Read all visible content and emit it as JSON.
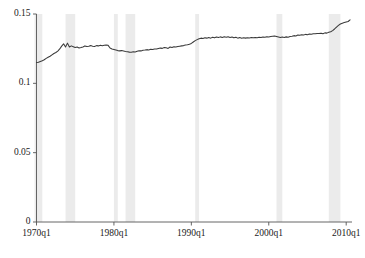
{
  "chart_data": {
    "type": "line",
    "title": "",
    "subtitle": "",
    "xlabel": "",
    "ylabel": "",
    "xlim": [
      1970.0,
      2010.75
    ],
    "ylim": [
      0,
      0.15
    ],
    "grid": false,
    "legend": null,
    "x_tick_labels": [
      "1970q1",
      "1980q1",
      "1990q1",
      "2000q1",
      "2010q1"
    ],
    "x_tick_values": [
      1970.0,
      1980.0,
      1990.0,
      2000.0,
      2010.0
    ],
    "y_tick_labels": [
      "0",
      "0.05",
      "0.1",
      "0.15"
    ],
    "y_tick_values": [
      0,
      0.05,
      0.1,
      0.15
    ],
    "line_color": "#3a3a3a",
    "recession_band_color": "#ebebeb",
    "axis_color": "#555555",
    "series": [
      {
        "name": "series1",
        "x": [
          1970.0,
          1970.25,
          1970.5,
          1970.75,
          1971.0,
          1971.25,
          1971.5,
          1971.75,
          1972.0,
          1972.25,
          1972.5,
          1972.75,
          1973.0,
          1973.25,
          1973.5,
          1973.75,
          1974.0,
          1974.25,
          1974.5,
          1974.75,
          1975.0,
          1975.25,
          1975.5,
          1975.75,
          1976.0,
          1976.25,
          1976.5,
          1976.75,
          1977.0,
          1977.25,
          1977.5,
          1977.75,
          1978.0,
          1978.25,
          1978.5,
          1978.75,
          1979.0,
          1979.25,
          1979.5,
          1979.75,
          1980.0,
          1980.25,
          1980.5,
          1980.75,
          1981.0,
          1981.25,
          1981.5,
          1981.75,
          1982.0,
          1982.25,
          1982.5,
          1982.75,
          1983.0,
          1983.25,
          1983.5,
          1983.75,
          1984.0,
          1984.25,
          1984.5,
          1984.75,
          1985.0,
          1985.25,
          1985.5,
          1985.75,
          1986.0,
          1986.25,
          1986.5,
          1986.75,
          1987.0,
          1987.25,
          1987.5,
          1987.75,
          1988.0,
          1988.25,
          1988.5,
          1988.75,
          1989.0,
          1989.25,
          1989.5,
          1989.75,
          1990.0,
          1990.25,
          1990.5,
          1990.75,
          1991.0,
          1991.25,
          1991.5,
          1991.75,
          1992.0,
          1992.25,
          1992.5,
          1992.75,
          1993.0,
          1993.25,
          1993.5,
          1993.75,
          1994.0,
          1994.25,
          1994.5,
          1994.75,
          1995.0,
          1995.25,
          1995.5,
          1995.75,
          1996.0,
          1996.25,
          1996.5,
          1996.75,
          1997.0,
          1997.25,
          1997.5,
          1997.75,
          1998.0,
          1998.25,
          1998.5,
          1998.75,
          1999.0,
          1999.25,
          1999.5,
          1999.75,
          2000.0,
          2000.25,
          2000.5,
          2000.75,
          2001.0,
          2001.25,
          2001.5,
          2001.75,
          2002.0,
          2002.25,
          2002.5,
          2002.75,
          2003.0,
          2003.25,
          2003.5,
          2003.75,
          2004.0,
          2004.25,
          2004.5,
          2004.75,
          2005.0,
          2005.25,
          2005.5,
          2005.75,
          2006.0,
          2006.25,
          2006.5,
          2006.75,
          2007.0,
          2007.25,
          2007.5,
          2007.75,
          2008.0,
          2008.25,
          2008.5,
          2008.75,
          2009.0,
          2009.25,
          2009.5,
          2009.75,
          2010.0,
          2010.25,
          2010.5
        ],
        "y": [
          0.115,
          0.1152,
          0.1158,
          0.1163,
          0.117,
          0.118,
          0.1188,
          0.1195,
          0.1205,
          0.1215,
          0.1222,
          0.1232,
          0.1248,
          0.1268,
          0.1285,
          0.1262,
          0.129,
          0.1262,
          0.127,
          0.1264,
          0.1258,
          0.1262,
          0.1255,
          0.1258,
          0.1262,
          0.127,
          0.1265,
          0.1268,
          0.1272,
          0.1268,
          0.1266,
          0.1272,
          0.127,
          0.1274,
          0.1271,
          0.1274,
          0.1276,
          0.1274,
          0.1255,
          0.1248,
          0.1244,
          0.124,
          0.1236,
          0.1234,
          0.1236,
          0.1233,
          0.123,
          0.1228,
          0.1225,
          0.1224,
          0.1228,
          0.1226,
          0.1231,
          0.1235,
          0.1234,
          0.1238,
          0.124,
          0.1243,
          0.1241,
          0.1245,
          0.1244,
          0.1248,
          0.1247,
          0.1251,
          0.1254,
          0.1252,
          0.1258,
          0.1256,
          0.1252,
          0.1262,
          0.1258,
          0.1264,
          0.1262,
          0.1266,
          0.1268,
          0.127,
          0.1272,
          0.1276,
          0.1278,
          0.1282,
          0.1288,
          0.1298,
          0.1308,
          0.1315,
          0.1322,
          0.1326,
          0.1324,
          0.1328,
          0.1326,
          0.133,
          0.1326,
          0.1332,
          0.1328,
          0.1334,
          0.133,
          0.1335,
          0.1331,
          0.1336,
          0.1332,
          0.1336,
          0.1331,
          0.1334,
          0.1328,
          0.1332,
          0.1326,
          0.133,
          0.1325,
          0.1328,
          0.1326,
          0.1329,
          0.1327,
          0.133,
          0.1328,
          0.1331,
          0.1329,
          0.1333,
          0.133,
          0.1334,
          0.1332,
          0.1336,
          0.1334,
          0.1338,
          0.134,
          0.1342,
          0.1338,
          0.1334,
          0.133,
          0.1334,
          0.1331,
          0.1335,
          0.1333,
          0.1338,
          0.134,
          0.1344,
          0.1342,
          0.1348,
          0.1346,
          0.135,
          0.1348,
          0.1353,
          0.1351,
          0.1356,
          0.1354,
          0.1358,
          0.1357,
          0.136,
          0.1359,
          0.1362,
          0.1358,
          0.1364,
          0.1362,
          0.1368,
          0.1372,
          0.138,
          0.1392,
          0.1406,
          0.1418,
          0.1428,
          0.1434,
          0.1438,
          0.1442,
          0.1446,
          0.1458
        ]
      }
    ],
    "recession_bands": [
      {
        "label": "1969-1970 recession",
        "start": 1969.75,
        "end": 1970.75
      },
      {
        "label": "1973-1975 recession",
        "start": 1973.75,
        "end": 1975.0
      },
      {
        "label": "1980 recession",
        "start": 1980.0,
        "end": 1980.5
      },
      {
        "label": "1981-1982 recession",
        "start": 1981.5,
        "end": 1982.75
      },
      {
        "label": "1990-1991 recession",
        "start": 1990.5,
        "end": 1991.0
      },
      {
        "label": "2001 recession",
        "start": 2001.0,
        "end": 2001.75
      },
      {
        "label": "2007-2009 recession",
        "start": 2007.75,
        "end": 2009.25
      }
    ]
  }
}
